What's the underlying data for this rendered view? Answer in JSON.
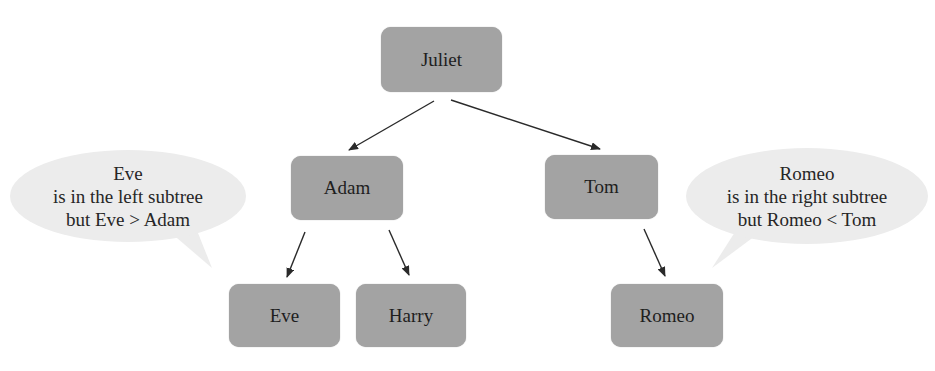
{
  "diagram": {
    "type": "binary-search-tree",
    "nodes": {
      "root": "Juliet",
      "left": "Adam",
      "right": "Tom",
      "left_left": "Eve",
      "left_right": "Harry",
      "right_left": "Romeo"
    },
    "edges": [
      {
        "from": "Juliet",
        "to": "Adam"
      },
      {
        "from": "Juliet",
        "to": "Tom"
      },
      {
        "from": "Adam",
        "to": "Eve"
      },
      {
        "from": "Adam",
        "to": "Harry"
      },
      {
        "from": "Tom",
        "to": "Romeo"
      }
    ],
    "callouts": {
      "left": {
        "line1": "Eve",
        "line2": "is in the left subtree",
        "line3": "but Eve > Adam"
      },
      "right": {
        "line1": "Romeo",
        "line2": "is in the right subtree",
        "line3": "but Romeo < Tom"
      }
    },
    "colors": {
      "node_fill": "#a3a3a3",
      "callout_fill": "#ececec",
      "arrow": "#333333"
    }
  }
}
